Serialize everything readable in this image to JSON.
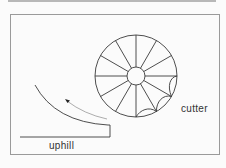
{
  "diagram": {
    "labels": {
      "cutter": "cutter",
      "uphill": "uphill"
    },
    "elements": [
      "frame",
      "cutter-wheel",
      "hub",
      "spokes-12",
      "scallops",
      "slope-arc",
      "motion-arrow",
      "ground-step"
    ],
    "colors": {
      "line": "#3a3a3a",
      "background": "#fbfbfb",
      "frame": "#9a9a9a"
    }
  }
}
